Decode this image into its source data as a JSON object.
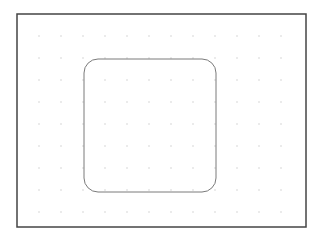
{
  "canvas": {
    "background": "#ffffff",
    "frame": {
      "x": 17,
      "y": 14,
      "width": 289,
      "height": 213,
      "stroke": "#444444",
      "stroke_width": 1.5
    },
    "grid": {
      "start_x": 39,
      "start_y": 36,
      "spacing": 22,
      "cols": 12,
      "rows": 9,
      "dot_color": "#c8c8c8",
      "dot_radius": 0.7
    },
    "shapes": [
      {
        "type": "rounded-rect",
        "x": 84,
        "y": 59,
        "width": 132,
        "height": 133,
        "rx": 14,
        "stroke": "#7a7a7a",
        "stroke_width": 1,
        "fill": "none"
      }
    ]
  }
}
